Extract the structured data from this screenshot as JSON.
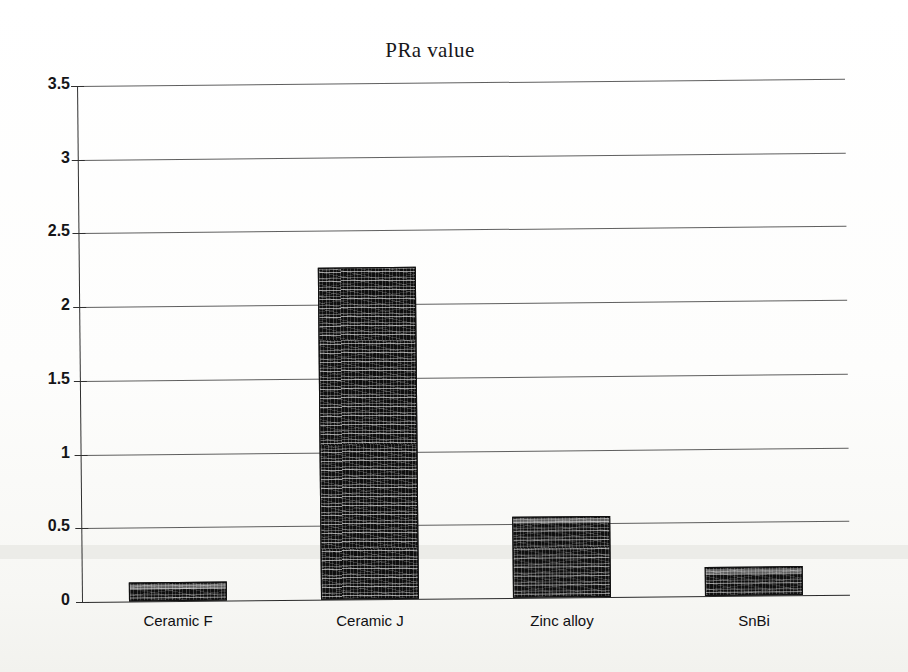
{
  "chart_data": {
    "type": "bar",
    "title": "PRa value",
    "xlabel": "",
    "ylabel": "",
    "categories": [
      "Ceramic F",
      "Ceramic J",
      "Zinc alloy",
      "SnBi"
    ],
    "values": [
      0.13,
      2.25,
      0.55,
      0.2
    ],
    "ylim": [
      0,
      3.5
    ],
    "ytick_labels": [
      "0",
      "0.5",
      "1",
      "1.5",
      "2",
      "2.5",
      "3",
      "3.5"
    ],
    "ytick_values": [
      0,
      0.5,
      1,
      1.5,
      2,
      2.5,
      3,
      3.5
    ],
    "grid": true,
    "legend": false,
    "series": [
      {
        "name": "PRa value",
        "values": [
          0.13,
          2.25,
          0.55,
          0.2
        ]
      }
    ],
    "colors": {
      "bar_fill": "#151515",
      "bar_edge": "#101010",
      "gridline": "#3c3c3c",
      "axis": "#2f2f2f",
      "background": "#fdfdfb",
      "text": "#151518"
    }
  }
}
